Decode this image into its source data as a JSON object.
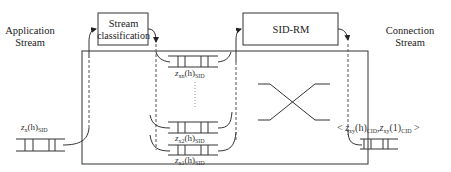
{
  "labels": {
    "application_stream_line1": "Application",
    "application_stream_line2": "Stream",
    "connection_stream_line1": "Connection",
    "connection_stream_line2": "Stream"
  },
  "boxes": {
    "stream_classification_line1": "Stream",
    "stream_classification_line2": "classification",
    "sid_rm": "SID-RM"
  },
  "queues": {
    "input": {
      "var": "z",
      "sub1": "x",
      "arg": "(h)",
      "sub2": "SID"
    },
    "queue_n": {
      "var": "z",
      "sub1": "xn",
      "arg": "(h)",
      "sub2": "SID"
    },
    "queue_2": {
      "var": "z",
      "sub1": "x2",
      "arg": "(h)",
      "sub2": "SID"
    },
    "queue_1": {
      "var": "z",
      "sub1": "x1",
      "arg": "(h)",
      "sub2": "SID"
    },
    "output": {
      "open": "<",
      "var1": "z",
      "sub1": "xy",
      "arg1": "(h)",
      "sub1b": "CID",
      "sep": ",",
      "var2": "z",
      "sub2": "xy",
      "arg2": "(1)",
      "sub2b": "CID",
      "close": ">"
    }
  },
  "colors": {
    "stroke": "#333333",
    "dashed": "#555555",
    "background": "#ffffff"
  }
}
